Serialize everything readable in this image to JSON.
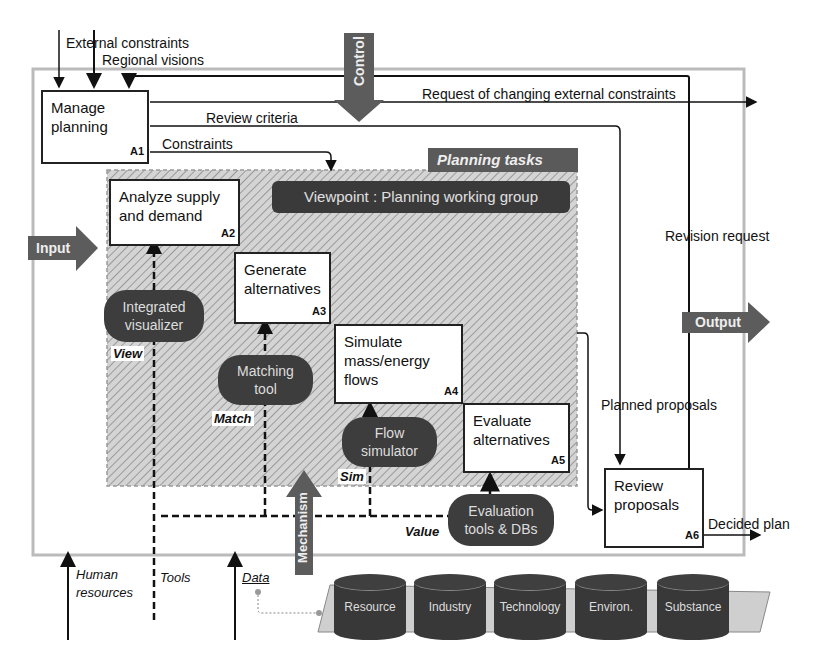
{
  "diagram": {
    "type": "IDEF0 activity diagram",
    "group_title": "Planning tasks",
    "viewpoint": "Viewpoint : Planning working group",
    "big_arrows": {
      "control": "Control",
      "input": "Input",
      "output": "Output",
      "mechanism": "Mechanism"
    },
    "activities": [
      {
        "code": "A1",
        "label_line1": "Manage",
        "label_line2": "planning"
      },
      {
        "code": "A2",
        "label_line1": "Analyze supply",
        "label_line2": "and demand"
      },
      {
        "code": "A3",
        "label_line1": "Generate",
        "label_line2": "alternatives"
      },
      {
        "code": "A4",
        "label_line1": "Simulate",
        "label_line2": "mass/energy",
        "label_line3": "flows"
      },
      {
        "code": "A5",
        "label_line1": "Evaluate",
        "label_line2": "alternatives"
      },
      {
        "code": "A6",
        "label_line1": "Review",
        "label_line2": "proposals"
      }
    ],
    "tools": [
      {
        "line1": "Integrated",
        "line2": "visualizer",
        "tag": "View"
      },
      {
        "line1": "Matching",
        "line2": "tool",
        "tag": "Match"
      },
      {
        "line1": "Flow",
        "line2": "simulator",
        "tag": "Sim"
      },
      {
        "line1": "Evaluation",
        "line2": "tools & DBs",
        "tag": "Value"
      }
    ],
    "flows": {
      "external_constraints": "External constraints",
      "regional_visions": "Regional visions",
      "request_changing": "Request of changing external constraints",
      "review_criteria": "Review criteria",
      "constraints": "Constraints",
      "revision_request": "Revision request",
      "planned_proposals": "Planned proposals",
      "decided_plan": "Decided plan"
    },
    "mechanisms": {
      "human_line1": "Human",
      "human_line2": "resources",
      "tools": "Tools",
      "data": "Data"
    },
    "databases": [
      "Resource",
      "Industry",
      "Technology",
      "Environ.",
      "Substance"
    ]
  }
}
